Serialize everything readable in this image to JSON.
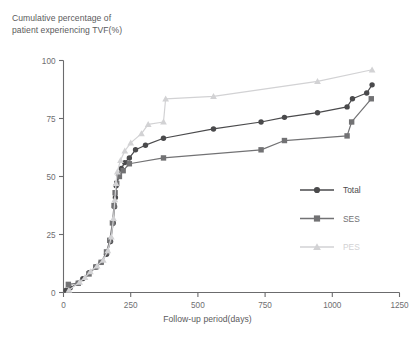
{
  "chart_data": {
    "type": "line",
    "title": "",
    "ylabel": "Cumulative percentage of\npatient experiencing TVF(%)",
    "xlabel": "Follow-up period(days)",
    "xlim": [
      0,
      1250
    ],
    "ylim": [
      0,
      100
    ],
    "xticks": [
      0,
      250,
      500,
      750,
      1000,
      1250
    ],
    "yticks": [
      0,
      25,
      50,
      75,
      100
    ],
    "grid": false,
    "legend_position": "center-right",
    "series": [
      {
        "name": "Total",
        "color": "#4a4a4c",
        "marker": "circle",
        "points": [
          [
            10,
            1.0
          ],
          [
            25,
            2.0
          ],
          [
            55,
            4.0
          ],
          [
            72,
            6.0
          ],
          [
            95,
            8.5
          ],
          [
            120,
            11.0
          ],
          [
            140,
            13.0
          ],
          [
            160,
            16.5
          ],
          [
            175,
            22.0
          ],
          [
            185,
            30.0
          ],
          [
            190,
            37.0
          ],
          [
            193,
            41.0
          ],
          [
            196,
            46.0
          ],
          [
            205,
            50.5
          ],
          [
            215,
            53.5
          ],
          [
            228,
            56.0
          ],
          [
            245,
            58.0
          ],
          [
            268,
            61.5
          ],
          [
            305,
            63.5
          ],
          [
            372,
            66.5
          ],
          [
            558,
            70.5
          ],
          [
            735,
            73.5
          ],
          [
            822,
            75.5
          ],
          [
            945,
            77.5
          ],
          [
            1055,
            80.0
          ],
          [
            1075,
            83.5
          ],
          [
            1128,
            86.0
          ],
          [
            1148,
            89.5
          ]
        ]
      },
      {
        "name": "SES",
        "color": "#727274",
        "marker": "square",
        "points": [
          [
            18,
            3.5
          ],
          [
            55,
            4.0
          ],
          [
            95,
            8.0
          ],
          [
            120,
            11.0
          ],
          [
            140,
            13.0
          ],
          [
            160,
            17.5
          ],
          [
            172,
            22.5
          ],
          [
            182,
            30.0
          ],
          [
            188,
            37.5
          ],
          [
            192,
            43.0
          ],
          [
            198,
            47.0
          ],
          [
            208,
            50.0
          ],
          [
            222,
            52.5
          ],
          [
            245,
            55.5
          ],
          [
            372,
            58.0
          ],
          [
            735,
            61.5
          ],
          [
            822,
            65.5
          ],
          [
            1055,
            67.5
          ],
          [
            1072,
            73.5
          ],
          [
            1145,
            83.5
          ]
        ]
      },
      {
        "name": "PES",
        "color": "#d2d2d4",
        "marker": "triangle",
        "points": [
          [
            20,
            1.0
          ],
          [
            60,
            4.5
          ],
          [
            80,
            6.5
          ],
          [
            100,
            9.0
          ],
          [
            125,
            11.5
          ],
          [
            148,
            14.0
          ],
          [
            165,
            18.0
          ],
          [
            178,
            24.0
          ],
          [
            186,
            32.0
          ],
          [
            191,
            40.0
          ],
          [
            195,
            47.0
          ],
          [
            200,
            52.0
          ],
          [
            212,
            57.0
          ],
          [
            228,
            61.0
          ],
          [
            250,
            64.5
          ],
          [
            290,
            68.5
          ],
          [
            315,
            72.5
          ],
          [
            372,
            73.5
          ],
          [
            380,
            83.5
          ],
          [
            558,
            84.5
          ],
          [
            945,
            91.0
          ],
          [
            1148,
            96.0
          ]
        ]
      }
    ]
  },
  "legend": {
    "items": [
      {
        "label": "Total",
        "color": "#4a4a4c",
        "marker": "circle"
      },
      {
        "label": "SES",
        "color": "#727274",
        "marker": "square"
      },
      {
        "label": "PES",
        "color": "#d2d2d4",
        "marker": "triangle"
      }
    ]
  }
}
